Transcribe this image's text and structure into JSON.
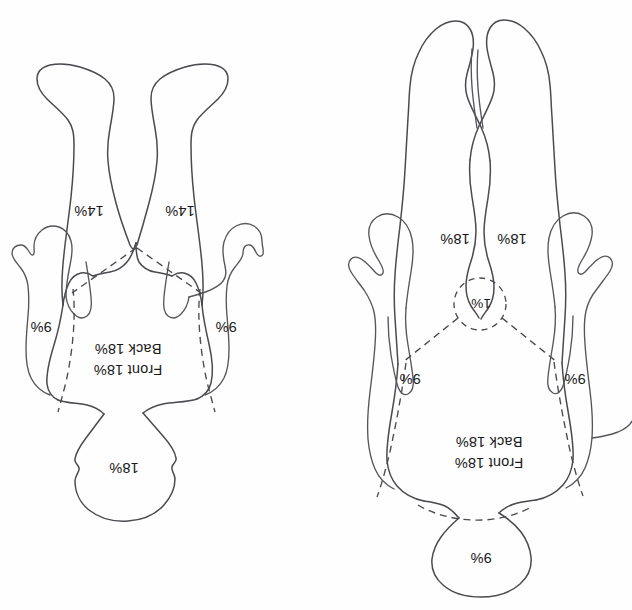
{
  "figure": {
    "orientation": "rotated-180",
    "background_color": "#fefefe",
    "line_color": "#4a4a4f",
    "text_color": "#1a1a1a"
  },
  "child_figure": {
    "name": "child-body-diagram",
    "labels": {
      "head": "18%",
      "left_arm": "9%",
      "right_arm": "9%",
      "left_leg": "14%",
      "right_leg": "14%",
      "torso_back": "Back 18%",
      "torso_front": "Front 18%"
    }
  },
  "adult_figure": {
    "name": "adult-body-diagram",
    "labels": {
      "head": "9%",
      "left_arm": "9%",
      "right_arm": "9%",
      "left_leg": "18%",
      "right_leg": "18%",
      "genitalia": "1%",
      "torso_back": "Back 18%",
      "torso_front": "Front 18%"
    }
  }
}
